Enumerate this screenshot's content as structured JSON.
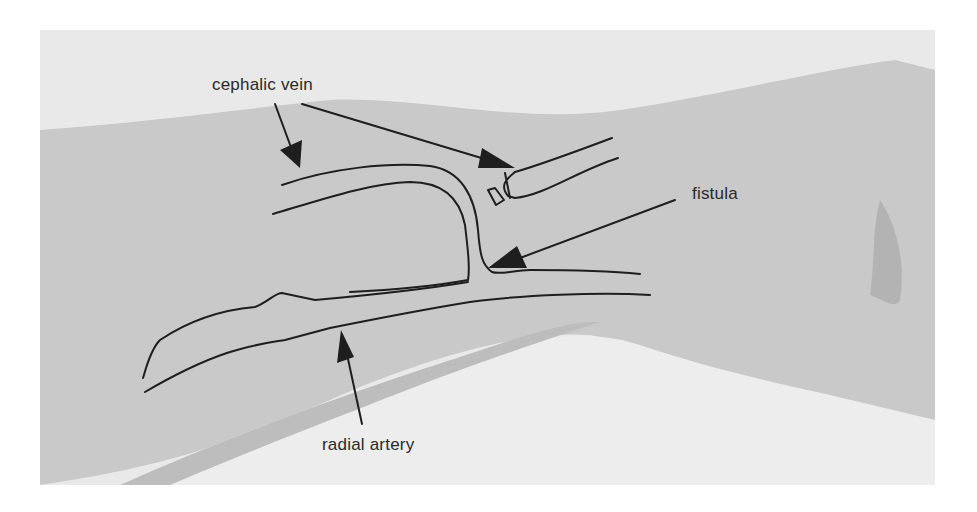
{
  "figure": {
    "type": "anatomical-diagram",
    "colors": {
      "background": "#ffffff",
      "photo_backdrop": "#e9e9e9",
      "skin": "#c9c9c9",
      "skin_shadow": "#b3b3b3",
      "lower_light": "#ededed",
      "ink": "#1e1e1e"
    }
  },
  "labels": {
    "cephalic_vein": "cephalic vein",
    "fistula": "fistula",
    "radial_artery": "radial artery"
  },
  "annotations": [
    {
      "label": "cephalic vein",
      "arrows": 2,
      "points_to": [
        "proximal cephalic vein",
        "ligated distal cephalic vein"
      ]
    },
    {
      "label": "fistula",
      "arrows": 1,
      "points_to": "vein-artery anastomosis"
    },
    {
      "label": "radial artery",
      "arrows": 1,
      "points_to": "radial artery"
    }
  ]
}
